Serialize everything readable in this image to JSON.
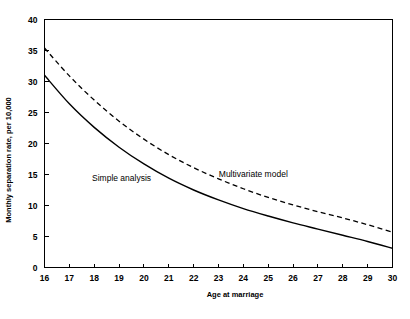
{
  "figure": {
    "background_color": "#ffffff",
    "line_color": "#000000"
  },
  "chart_data": {
    "type": "line",
    "title": "",
    "xlabel": "Age at marriage",
    "ylabel": "Monthly separation rate, per 10,000",
    "xlim": [
      16,
      30
    ],
    "ylim": [
      0,
      40
    ],
    "xticks": [
      16,
      17,
      18,
      19,
      20,
      21,
      22,
      23,
      24,
      25,
      26,
      27,
      28,
      29,
      30
    ],
    "yticks": [
      0,
      5,
      10,
      15,
      20,
      25,
      30,
      35,
      40
    ],
    "xtick_labels": [
      "16",
      "17",
      "18",
      "19",
      "20",
      "21",
      "22",
      "23",
      "24",
      "25",
      "26",
      "27",
      "28",
      "29",
      "30"
    ],
    "ytick_labels": [
      "0",
      "5",
      "10",
      "15",
      "20",
      "25",
      "30",
      "35",
      "40"
    ],
    "grid": false,
    "legend_position": "inline-annotations",
    "x": [
      16,
      17,
      18,
      19,
      20,
      21,
      22,
      23,
      24,
      25,
      26,
      27,
      28,
      29,
      30
    ],
    "series": [
      {
        "name": "Simple analysis",
        "style": "solid",
        "label_x": 19.1,
        "label_y": 13.9,
        "values": [
          31.0,
          26.4,
          22.6,
          19.4,
          16.7,
          14.4,
          12.5,
          10.9,
          9.5,
          8.3,
          7.2,
          6.2,
          5.2,
          4.2,
          3.1
        ]
      },
      {
        "name": "Multivariate model",
        "style": "dashed",
        "label_x": 24.4,
        "label_y": 14.6,
        "values": [
          35.4,
          30.9,
          27.0,
          23.6,
          20.7,
          18.2,
          16.1,
          14.3,
          12.7,
          11.3,
          10.1,
          9.0,
          8.0,
          6.9,
          5.7
        ]
      }
    ]
  }
}
